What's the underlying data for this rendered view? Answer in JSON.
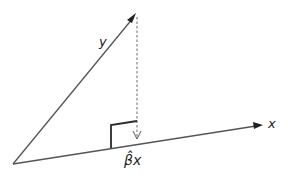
{
  "diagram": {
    "labels": {
      "y": "y",
      "x": "x",
      "projection": "β̂x"
    },
    "geometry": {
      "origin": [
        13,
        164
      ],
      "y_tip": [
        136,
        14
      ],
      "x_tip": [
        262,
        125
      ],
      "projection_foot": [
        137,
        139
      ],
      "right_angle_marker": {
        "corner_bottom": [
          111,
          148
        ],
        "corner_top": [
          111,
          125
        ],
        "end": [
          137,
          121
        ]
      }
    },
    "colors": {
      "line": "#555555",
      "arrowhead": "#222222",
      "dashed": "#6a6a6a",
      "right_angle": "#2b2b2b",
      "text": "#222222",
      "background": "#ffffff"
    }
  }
}
